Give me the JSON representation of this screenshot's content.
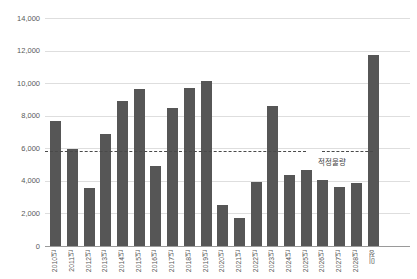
{
  "chart_data": {
    "type": "bar",
    "title": "",
    "xlabel": "",
    "ylabel": "",
    "categories": [
      "2010년",
      "2011년",
      "2012년",
      "2013년",
      "2014년",
      "2015년",
      "2016년",
      "2017년",
      "2018년",
      "2019년",
      "2020년",
      "2021년",
      "2022년",
      "2023년",
      "2024년",
      "2025년",
      "2026년",
      "2027년",
      "2028년",
      "미정"
    ],
    "values": [
      7650,
      5950,
      3550,
      6850,
      8900,
      9650,
      4900,
      8500,
      9700,
      10150,
      2500,
      1700,
      3900,
      8600,
      4350,
      4650,
      4050,
      3650,
      3850,
      11700
    ],
    "ylim": [
      0,
      14000
    ],
    "yticks": [
      {
        "value": 14000,
        "label": "14,000"
      },
      {
        "value": 12000,
        "label": "12,000"
      },
      {
        "value": 10000,
        "label": "10,000"
      },
      {
        "value": 8000,
        "label": "8,000"
      },
      {
        "value": 6000,
        "label": "6,000"
      },
      {
        "value": 4000,
        "label": "4,000"
      },
      {
        "value": 2000,
        "label": "2,000"
      },
      {
        "value": 0,
        "label": "0"
      }
    ],
    "grid": "horizontal",
    "legend": "none",
    "reference_line": {
      "value": 5850,
      "label": "적정물량",
      "style": "dashed"
    },
    "colors": {
      "bar": "#565656",
      "gridline": "#dedede",
      "axis": "#9a9a9a",
      "tick_text": "#595959",
      "reference_line": "#4a4a4a",
      "reference_label": "#3f3f3f",
      "background": "#ffffff"
    }
  }
}
